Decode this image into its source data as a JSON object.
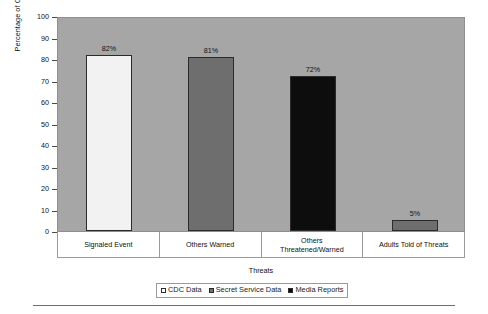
{
  "chart_data": {
    "type": "bar",
    "title": "",
    "xlabel": "Threats",
    "ylabel": "Percentage of Cases",
    "ylim": [
      0,
      100
    ],
    "yticks": [
      0,
      10,
      20,
      30,
      40,
      50,
      60,
      70,
      80,
      90,
      100
    ],
    "ytick_labels": [
      "0",
      "10",
      "20",
      "30",
      "40",
      "50",
      "60",
      "70",
      "80",
      "90",
      "100"
    ],
    "grid": false,
    "legend_position": "bottom",
    "categories": [
      "Signaled Event",
      "Others Warned",
      "Others Threatened/Warned",
      "Adults Told of Threats"
    ],
    "category_lines": [
      [
        "Signaled Event"
      ],
      [
        "Others Warned"
      ],
      [
        "Others",
        "Threatened/Warned"
      ],
      [
        "Adults Told of Threats"
      ]
    ],
    "series": [
      {
        "name": "CDC Data",
        "color": "#f2f2f2",
        "values": [
          82,
          null,
          null,
          null
        ]
      },
      {
        "name": "Secret Service Data",
        "color": "#6e6e6e",
        "values": [
          null,
          81,
          null,
          5
        ]
      },
      {
        "name": "Media Reports",
        "color": "#0d0d0d",
        "values": [
          null,
          null,
          72,
          null
        ]
      }
    ],
    "bars": [
      {
        "category": "Signaled Event",
        "series": "CDC Data",
        "value": 82,
        "label": "82%",
        "color": "#f2f2f2"
      },
      {
        "category": "Others Warned",
        "series": "Secret Service Data",
        "value": 81,
        "label": "81%",
        "color": "#6e6e6e"
      },
      {
        "category": "Others Threatened/Warned",
        "series": "Media Reports",
        "value": 72,
        "label": "72%",
        "color": "#0d0d0d"
      },
      {
        "category": "Adults Told of Threats",
        "series": "Secret Service Data",
        "value": 5,
        "label": "5%",
        "color": "#6e6e6e"
      }
    ],
    "plot_background": "#a6a6a6",
    "figure_background": "#ffffff"
  },
  "legend": {
    "items": [
      {
        "label": "CDC Data",
        "color": "#ffffff"
      },
      {
        "label": "Secret Service Data",
        "color": "#6e6e6e"
      },
      {
        "label": "Media Reports",
        "color": "#0d0d0d"
      }
    ]
  }
}
